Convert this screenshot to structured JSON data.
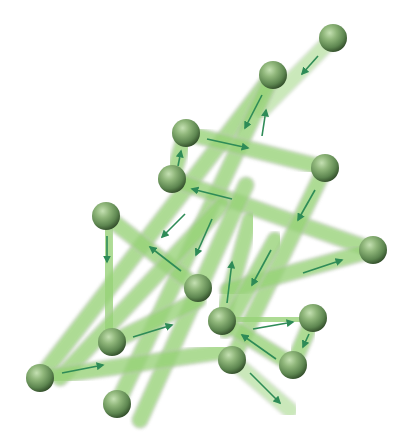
{
  "diagram": {
    "type": "node-link path diagram with directional arrows",
    "colors": {
      "background": "#ffffff",
      "rod": "#8fd46a",
      "rod_edge": "#b9c9b0",
      "arrow": "#2e8b57",
      "node_light": "#a9cc94",
      "node_mid": "#6e9a5c",
      "node_dark": "#3f5f34"
    },
    "nodes": [
      {
        "id": "n1",
        "x": 333,
        "y": 38
      },
      {
        "id": "n2",
        "x": 273,
        "y": 75
      },
      {
        "id": "n3",
        "x": 186,
        "y": 133
      },
      {
        "id": "n4",
        "x": 325,
        "y": 168
      },
      {
        "id": "n5",
        "x": 172,
        "y": 179
      },
      {
        "id": "n6",
        "x": 106,
        "y": 216
      },
      {
        "id": "n7",
        "x": 373,
        "y": 250
      },
      {
        "id": "n8",
        "x": 198,
        "y": 288
      },
      {
        "id": "n9",
        "x": 222,
        "y": 321
      },
      {
        "id": "n10",
        "x": 313,
        "y": 318
      },
      {
        "id": "n11",
        "x": 112,
        "y": 342
      },
      {
        "id": "n12",
        "x": 232,
        "y": 360
      },
      {
        "id": "n13",
        "x": 293,
        "y": 365
      },
      {
        "id": "n14",
        "x": 40,
        "y": 378
      },
      {
        "id": "n15",
        "x": 117,
        "y": 404
      }
    ],
    "edges": [
      {
        "from": [
          333,
          38
        ],
        "to": [
          262,
          110
        ],
        "arrow": [
          [
            318,
            56
          ],
          [
            302,
            74
          ]
        ],
        "fade": true
      },
      {
        "from": [
          273,
          75
        ],
        "to": [
          40,
          378
        ],
        "arrow": [
          [
            262,
            95
          ],
          [
            245,
            128
          ]
        ]
      },
      {
        "from": [
          117,
          404
        ],
        "to": [
          273,
          75
        ],
        "arrow": [
          [
            262,
            136
          ],
          [
            266,
            110
          ]
        ]
      },
      {
        "from": [
          186,
          133
        ],
        "to": [
          325,
          168
        ],
        "arrow": [
          [
            207,
            139
          ],
          [
            248,
            148
          ]
        ]
      },
      {
        "from": [
          172,
          179
        ],
        "to": [
          186,
          133
        ],
        "arrow": [
          [
            178,
            166
          ],
          [
            181,
            151
          ]
        ]
      },
      {
        "from": [
          373,
          250
        ],
        "to": [
          172,
          179
        ],
        "arrow": [
          [
            232,
            199
          ],
          [
            192,
            189
          ]
        ]
      },
      {
        "from": [
          325,
          168
        ],
        "to": [
          232,
          360
        ],
        "arrow": [
          [
            315,
            190
          ],
          [
            298,
            220
          ]
        ]
      },
      {
        "from": [
          106,
          216
        ],
        "to": [
          112,
          342
        ],
        "arrow": [
          [
            107,
            236
          ],
          [
            107,
            262
          ]
        ]
      },
      {
        "from": [
          198,
          288
        ],
        "to": [
          106,
          216
        ],
        "arrow": [
          [
            181,
            271
          ],
          [
            150,
            247
          ]
        ]
      },
      {
        "from": [
          222,
          205
        ],
        "to": [
          60,
          378
        ],
        "arrow": [
          [
            185,
            214
          ],
          [
            162,
            237
          ]
        ]
      },
      {
        "from": [
          246,
          185
        ],
        "to": [
          140,
          420
        ],
        "arrow": [
          [
            212,
            219
          ],
          [
            196,
            255
          ]
        ]
      },
      {
        "from": [
          112,
          342
        ],
        "to": [
          198,
          300
        ],
        "arrow": [
          [
            133,
            337
          ],
          [
            172,
            325
          ]
        ]
      },
      {
        "from": [
          40,
          378
        ],
        "to": [
          232,
          350
        ],
        "arrow": [
          [
            62,
            373
          ],
          [
            103,
            365
          ]
        ]
      },
      {
        "from": [
          222,
          321
        ],
        "to": [
          250,
          220
        ],
        "arrow": [
          [
            227,
            303
          ],
          [
            232,
            262
          ]
        ]
      },
      {
        "from": [
          228,
          290
        ],
        "to": [
          373,
          250
        ],
        "arrow": [
          [
            303,
            273
          ],
          [
            342,
            260
          ]
        ]
      },
      {
        "from": [
          275,
          240
        ],
        "to": [
          225,
          330
        ],
        "arrow": [
          [
            271,
            250
          ],
          [
            252,
            285
          ]
        ]
      },
      {
        "from": [
          222,
          321
        ],
        "to": [
          313,
          318
        ],
        "arrow": [
          [
            253,
            329
          ],
          [
            293,
            322
          ]
        ]
      },
      {
        "from": [
          313,
          318
        ],
        "to": [
          293,
          365
        ],
        "arrow": [
          [
            309,
            334
          ],
          [
            303,
            347
          ]
        ]
      },
      {
        "from": [
          293,
          365
        ],
        "to": [
          222,
          321
        ],
        "arrow": [
          [
            276,
            359
          ],
          [
            242,
            335
          ]
        ]
      },
      {
        "from": [
          232,
          360
        ],
        "to": [
          290,
          410
        ],
        "arrow": [
          [
            250,
            373
          ],
          [
            280,
            403
          ]
        ],
        "fade": true
      }
    ]
  }
}
